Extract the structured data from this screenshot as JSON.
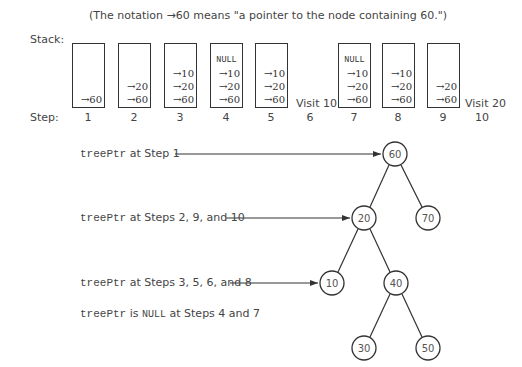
{
  "title_note": "(The notation →60 means \"a pointer to the node containing 60.\")",
  "stack_label": "Stack:",
  "step_label": "Step:",
  "steps": [
    {
      "step": "1",
      "stack": [
        "→60"
      ],
      "visit": ""
    },
    {
      "step": "2",
      "stack": [
        "→20",
        "→60"
      ],
      "visit": ""
    },
    {
      "step": "3",
      "stack": [
        "→10",
        "→20",
        "→60"
      ],
      "visit": ""
    },
    {
      "step": "4",
      "stack": [
        "NULL",
        "→10",
        "→20",
        "→60"
      ],
      "visit": ""
    },
    {
      "step": "5",
      "stack": [
        "→10",
        "→20",
        "→60"
      ],
      "visit": ""
    },
    {
      "step": "6",
      "stack": null,
      "visit": "Visit 10"
    },
    {
      "step": "7",
      "stack": [
        "NULL",
        "→10",
        "→20",
        "→60"
      ],
      "visit": ""
    },
    {
      "step": "8",
      "stack": [
        "→10",
        "→20",
        "→60"
      ],
      "visit": ""
    },
    {
      "step": "9",
      "stack": [
        "→20",
        "→60"
      ],
      "visit": ""
    },
    {
      "step": "10",
      "stack": null,
      "visit": "Visit 20"
    }
  ],
  "pointer_labels": [
    {
      "var": "treePtr",
      "text": " at Step 1",
      "target": "60"
    },
    {
      "var": "treePtr",
      "text": " at Steps 2, 9, and 10",
      "target": "20"
    },
    {
      "var": "treePtr",
      "text": " at Steps 3, 5, 6, and 8",
      "target": "10"
    }
  ],
  "null_note": {
    "var": "treePtr",
    "mid": " is ",
    "null": "NULL",
    "tail": " at Steps 4 and 7"
  },
  "tree": {
    "nodes": [
      {
        "id": "60",
        "label": "60"
      },
      {
        "id": "20",
        "label": "20"
      },
      {
        "id": "70",
        "label": "70"
      },
      {
        "id": "10",
        "label": "10"
      },
      {
        "id": "40",
        "label": "40"
      },
      {
        "id": "30",
        "label": "30"
      },
      {
        "id": "50",
        "label": "50"
      }
    ],
    "edges": [
      [
        "60",
        "20"
      ],
      [
        "60",
        "70"
      ],
      [
        "20",
        "10"
      ],
      [
        "20",
        "40"
      ],
      [
        "40",
        "30"
      ],
      [
        "40",
        "50"
      ]
    ]
  }
}
